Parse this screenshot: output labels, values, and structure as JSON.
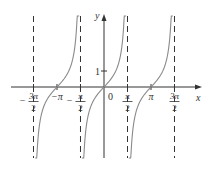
{
  "chart_data": {
    "type": "line",
    "title": "",
    "function": "y = tan(x)",
    "xlabel": "x",
    "ylabel": "y",
    "origin_label": "0",
    "x_range": [
      -4.4,
      4.6
    ],
    "y_range": [
      -4.4,
      4.4
    ],
    "x_ticks": [
      {
        "value": -4.712,
        "label_num": "3π",
        "label_den": "2",
        "sign": "−"
      },
      {
        "value": -3.1416,
        "label": "−π"
      },
      {
        "value": -1.5708,
        "label_num": "π",
        "label_den": "2",
        "sign": "−"
      },
      {
        "value": 1.5708,
        "label_num": "π",
        "label_den": "2",
        "sign": ""
      },
      {
        "value": 3.1416,
        "label": "π"
      },
      {
        "value": 4.712,
        "label_num": "3π",
        "label_den": "2",
        "sign": ""
      }
    ],
    "y_ticks": [
      {
        "value": 1,
        "label": "1"
      }
    ],
    "asymptotes": [
      -4.712,
      -1.5708,
      1.5708,
      4.712
    ],
    "branches": [
      {
        "x_from": -4.6,
        "x_to": -1.66
      },
      {
        "x_from": -1.48,
        "x_to": 1.48
      },
      {
        "x_from": 1.66,
        "x_to": 4.6
      }
    ],
    "zeros": [
      -3.1416,
      0,
      3.1416
    ],
    "grid": false,
    "legend": null,
    "colors": {
      "curve": "#8a8a8a",
      "axes": "#333333",
      "asymptote": "#333333"
    }
  }
}
